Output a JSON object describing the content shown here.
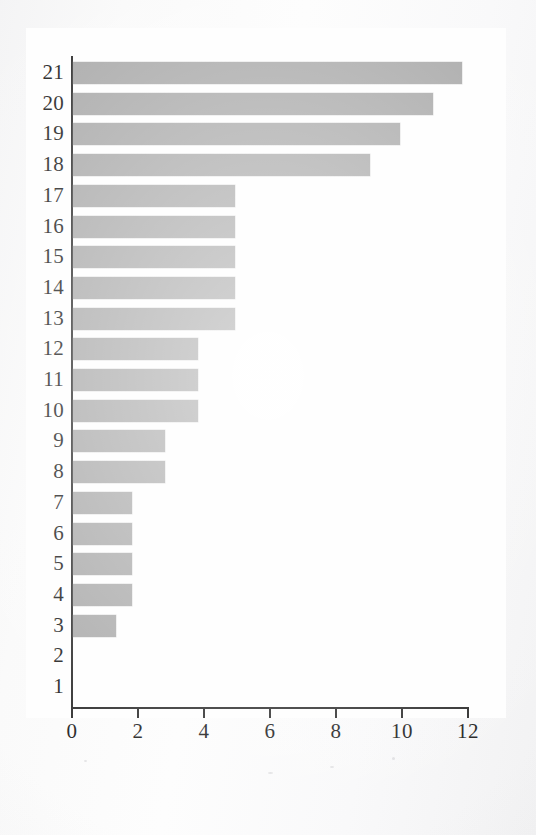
{
  "chart_data": {
    "type": "bar",
    "orientation": "horizontal",
    "title": "",
    "xlabel": "",
    "ylabel": "",
    "xlim": [
      0,
      12
    ],
    "xticks": [
      0,
      2,
      4,
      6,
      8,
      10,
      12
    ],
    "xtick_labels": [
      "0",
      "2",
      "4",
      "6",
      "8",
      "10",
      "12"
    ],
    "grid": false,
    "legend": false,
    "bar_color": "#a9a9a9",
    "axis_color": "#2b2b2b",
    "background_color": "#fbfbfb",
    "categories": [
      "21",
      "20",
      "19",
      "18",
      "17",
      "16",
      "15",
      "14",
      "13",
      "12",
      "11",
      "10",
      "9",
      "8",
      "7",
      "6",
      "5",
      "4",
      "3",
      "2",
      "1"
    ],
    "values": [
      11.8,
      10.9,
      9.9,
      9.0,
      4.9,
      4.9,
      4.9,
      4.9,
      4.9,
      3.8,
      3.8,
      3.8,
      2.8,
      2.8,
      1.8,
      1.8,
      1.8,
      1.8,
      1.3,
      0,
      0
    ],
    "series": [
      {
        "name": "value",
        "values": [
          11.8,
          10.9,
          9.9,
          9.0,
          4.9,
          4.9,
          4.9,
          4.9,
          4.9,
          3.8,
          3.8,
          3.8,
          2.8,
          2.8,
          1.8,
          1.8,
          1.8,
          1.8,
          1.3,
          0,
          0
        ]
      }
    ]
  }
}
